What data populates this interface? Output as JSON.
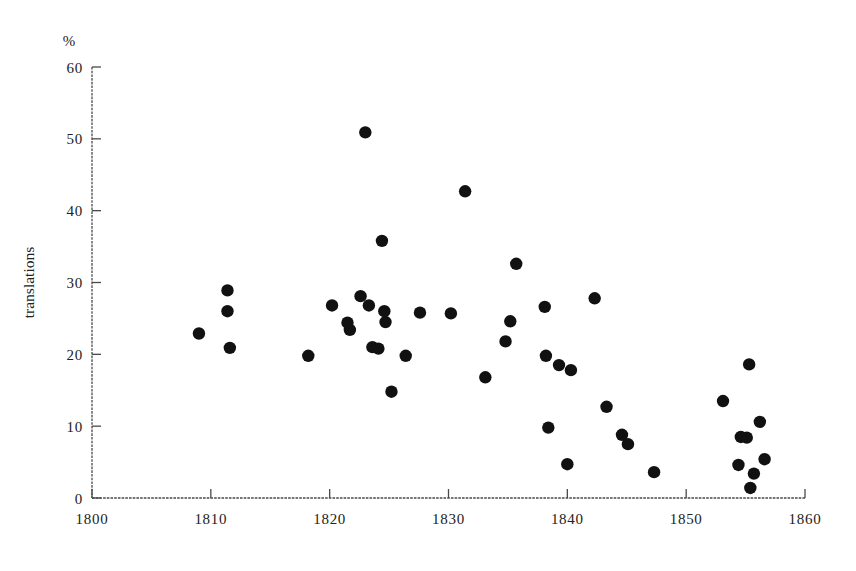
{
  "chart_data": {
    "type": "scatter",
    "title": "",
    "subtitle": "",
    "xlabel": "",
    "ylabel": "translations",
    "y_unit_label": "%",
    "xlim": [
      1800,
      1860
    ],
    "ylim": [
      0,
      60
    ],
    "x_ticks": [
      1800,
      1810,
      1820,
      1830,
      1840,
      1850,
      1860
    ],
    "x_tick_labels": [
      "1800",
      "1810",
      "1820",
      "1830",
      "1840",
      "1850",
      "1860"
    ],
    "y_ticks": [
      0,
      10,
      20,
      30,
      40,
      50,
      60
    ],
    "y_tick_labels": [
      "0",
      "10",
      "20",
      "30",
      "40",
      "50",
      "60"
    ],
    "grid": false,
    "legend": null,
    "marker": {
      "shape": "circle",
      "color": "#111111",
      "radius_px": 6.2
    },
    "axis_color": "#4a4a4a",
    "background_color": "#ffffff",
    "points": [
      {
        "x": 1809.0,
        "y": 22.9
      },
      {
        "x": 1811.4,
        "y": 28.9
      },
      {
        "x": 1811.4,
        "y": 26.0
      },
      {
        "x": 1811.6,
        "y": 20.9
      },
      {
        "x": 1818.2,
        "y": 19.8
      },
      {
        "x": 1820.2,
        "y": 26.8
      },
      {
        "x": 1821.5,
        "y": 24.4
      },
      {
        "x": 1821.7,
        "y": 23.4
      },
      {
        "x": 1822.6,
        "y": 28.1
      },
      {
        "x": 1823.0,
        "y": 50.9
      },
      {
        "x": 1823.3,
        "y": 26.8
      },
      {
        "x": 1823.6,
        "y": 21.0
      },
      {
        "x": 1824.1,
        "y": 20.8
      },
      {
        "x": 1824.4,
        "y": 35.8
      },
      {
        "x": 1824.6,
        "y": 26.0
      },
      {
        "x": 1824.7,
        "y": 24.5
      },
      {
        "x": 1825.2,
        "y": 14.8
      },
      {
        "x": 1826.4,
        "y": 19.8
      },
      {
        "x": 1827.6,
        "y": 25.8
      },
      {
        "x": 1830.2,
        "y": 25.7
      },
      {
        "x": 1831.4,
        "y": 42.7
      },
      {
        "x": 1833.1,
        "y": 16.8
      },
      {
        "x": 1834.8,
        "y": 21.8
      },
      {
        "x": 1835.2,
        "y": 24.6
      },
      {
        "x": 1835.7,
        "y": 32.6
      },
      {
        "x": 1838.1,
        "y": 26.6
      },
      {
        "x": 1838.2,
        "y": 19.8
      },
      {
        "x": 1838.4,
        "y": 9.8
      },
      {
        "x": 1839.3,
        "y": 18.5
      },
      {
        "x": 1840.0,
        "y": 4.7
      },
      {
        "x": 1840.3,
        "y": 17.8
      },
      {
        "x": 1842.3,
        "y": 27.8
      },
      {
        "x": 1843.3,
        "y": 12.7
      },
      {
        "x": 1844.6,
        "y": 8.8
      },
      {
        "x": 1845.1,
        "y": 7.5
      },
      {
        "x": 1847.3,
        "y": 3.6
      },
      {
        "x": 1853.1,
        "y": 13.5
      },
      {
        "x": 1854.4,
        "y": 4.6
      },
      {
        "x": 1854.6,
        "y": 8.5
      },
      {
        "x": 1855.1,
        "y": 8.4
      },
      {
        "x": 1855.3,
        "y": 18.6
      },
      {
        "x": 1855.4,
        "y": 1.4
      },
      {
        "x": 1855.7,
        "y": 3.4
      },
      {
        "x": 1856.2,
        "y": 10.6
      },
      {
        "x": 1856.6,
        "y": 5.4
      }
    ]
  }
}
